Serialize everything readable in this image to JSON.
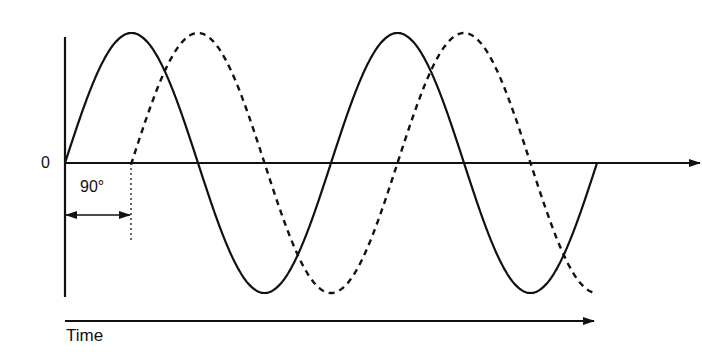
{
  "diagram": {
    "title": "",
    "labels": {
      "zero": "0",
      "phase_shift": "90°",
      "time_axis": "Time"
    },
    "colors": {
      "stroke": "#111111",
      "background": "#ffffff"
    },
    "waves": [
      {
        "name": "reference-wave",
        "style": "solid",
        "phase_deg": 0
      },
      {
        "name": "lagging-wave",
        "style": "dashed",
        "phase_deg": -90
      }
    ]
  },
  "chart_data": {
    "type": "line",
    "title": "",
    "xlabel": "Time",
    "ylabel": "",
    "y_tick_labels": [
      "0"
    ],
    "annotation": "90°",
    "series": [
      {
        "name": "solid sine",
        "style": "solid",
        "x_degrees": [
          0,
          90,
          180,
          270,
          360,
          450,
          540,
          630,
          720
        ],
        "values": [
          0,
          1,
          0,
          -1,
          0,
          1,
          0,
          -1,
          0
        ]
      },
      {
        "name": "dashed sine (lagging 90°)",
        "style": "dashed",
        "x_degrees": [
          90,
          180,
          270,
          360,
          450,
          540,
          630,
          720,
          800
        ],
        "values": [
          0,
          1,
          0,
          -1,
          0,
          1,
          0,
          -1,
          -0.95
        ]
      }
    ],
    "grid": false
  }
}
